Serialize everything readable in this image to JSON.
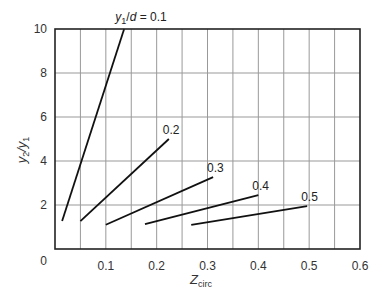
{
  "chart_data": {
    "type": "line",
    "title": "",
    "xlabel": "Z_circ",
    "xlabel_main": "Z",
    "xlabel_sub": "circ",
    "ylabel": "y2/y1",
    "xlim": [
      0,
      0.6
    ],
    "ylim": [
      0,
      10
    ],
    "x_ticks": [
      "0",
      "0.1",
      "0.2",
      "0.3",
      "0.4",
      "0.5",
      "0.6"
    ],
    "y_ticks": [
      "0",
      "2",
      "4",
      "6",
      "8",
      "10"
    ],
    "grid": true,
    "x_grid_step": 0.05,
    "y_grid_step": 2,
    "series_label_prefix": "y1/d = ",
    "series": [
      {
        "name": "0.1",
        "label": "y1/d = 0.1",
        "x": [
          0.014,
          0.136
        ],
        "y": [
          1.27,
          10.0
        ]
      },
      {
        "name": "0.2",
        "label": "0.2",
        "x": [
          0.05,
          0.224
        ],
        "y": [
          1.27,
          5.0
        ]
      },
      {
        "name": "0.3",
        "label": "0.3",
        "x": [
          0.1,
          0.311
        ],
        "y": [
          1.1,
          3.27
        ]
      },
      {
        "name": "0.4",
        "label": "0.4",
        "x": [
          0.177,
          0.4
        ],
        "y": [
          1.13,
          2.45
        ]
      },
      {
        "name": "0.5",
        "label": "0.5",
        "x": [
          0.268,
          0.496
        ],
        "y": [
          1.1,
          1.95
        ]
      }
    ]
  }
}
